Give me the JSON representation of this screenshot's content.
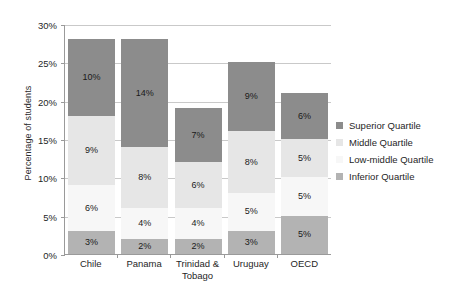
{
  "chart_data": {
    "type": "bar",
    "subtype": "stacked-bar",
    "title": "",
    "xlabel": "",
    "ylabel": "Percentage of students",
    "ylim": [
      0,
      30
    ],
    "ytick_step": 5,
    "ytick_labels": [
      "0%",
      "5%",
      "10%",
      "15%",
      "20%",
      "25%",
      "30%"
    ],
    "ytick_values": [
      0,
      5,
      10,
      15,
      20,
      25,
      30
    ],
    "grid": true,
    "legend_position": "right",
    "categories": [
      "Chile",
      "Panama",
      "Trinidad & Tobago",
      "Uruguay",
      "OECD"
    ],
    "category_lines": [
      [
        "Chile"
      ],
      [
        "Panama"
      ],
      [
        "Trinidad &",
        "Tobago"
      ],
      [
        "Uruguay"
      ],
      [
        "OECD"
      ]
    ],
    "series": [
      {
        "name": "Inferior Quartile",
        "color": "#b3b3b3",
        "values": [
          3,
          2,
          2,
          3,
          5
        ],
        "labels": [
          "3%",
          "2%",
          "2%",
          "3%",
          "5%"
        ]
      },
      {
        "name": "Low-middle Quartile",
        "color": "#f7f7f7",
        "values": [
          6,
          4,
          4,
          5,
          5
        ],
        "labels": [
          "6%",
          "4%",
          "4%",
          "5%",
          "5%"
        ]
      },
      {
        "name": "Middle Quartile",
        "color": "#e6e6e6",
        "values": [
          9,
          8,
          6,
          8,
          5
        ],
        "labels": [
          "9%",
          "8%",
          "6%",
          "8%",
          "5%"
        ]
      },
      {
        "name": "Superior Quartile",
        "color": "#8c8c8c",
        "values": [
          10,
          14,
          7,
          9,
          6
        ],
        "labels": [
          "10%",
          "14%",
          "7%",
          "9%",
          "6%"
        ]
      }
    ],
    "totals": [
      28,
      28,
      19,
      25,
      21
    ]
  },
  "legend": {
    "items": [
      {
        "label": "Superior Quartile",
        "color": "#8c8c8c"
      },
      {
        "label": "Middle Quartile",
        "color": "#e6e6e6"
      },
      {
        "label": "Low-middle Quartile",
        "color": "#f7f7f7"
      },
      {
        "label": "Inferior Quartile",
        "color": "#b3b3b3"
      }
    ]
  },
  "colors": {
    "gridline": "#c9c9c9",
    "axis": "#9a9a9a",
    "text": "#1f1f1f",
    "background": "#ffffff"
  }
}
